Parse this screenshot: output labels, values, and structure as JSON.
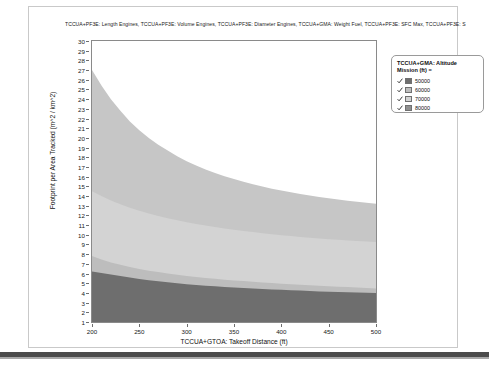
{
  "panel": {
    "chart_title": "TCCUA+PF3E: Length Engines, TCCUA+PF3E: Volume Engines, TCCUA+PF3E: Diameter Engines, TCCUA+GMA: Weight Fuel, TCCUA+PF3E: SFC Max, TCCUA+PF3E: S"
  },
  "legend": {
    "title_line1": "TCCUA+GMA: Altitude",
    "title_line2": "Mission (ft) =",
    "check_glyph": "check-mark-icon",
    "items": [
      {
        "label": "50000",
        "color": "#6e6e6e",
        "checked": true
      },
      {
        "label": "60000",
        "color": "#bdbdbd",
        "checked": true
      },
      {
        "label": "70000",
        "color": "#d3d3d3",
        "checked": true
      },
      {
        "label": "80000",
        "color": "#8f8f8f",
        "checked": true
      }
    ]
  },
  "chart_data": {
    "type": "area",
    "title": "TCCUA+PF3E: Length Engines, TCCUA+PF3E: Volume Engines, TCCUA+PF3E: Diameter Engines, TCCUA+GMA: Weight Fuel, TCCUA+PF3E: SFC Max, TCCUA+PF3E: S",
    "xlabel": "TCCUA+GTOA: Takeoff Distance (ft)",
    "ylabel": "Footprint per Area Tracked (m^2 / km^2)",
    "xlim": [
      200,
      500
    ],
    "ylim": [
      1,
      30
    ],
    "xticks": [
      200,
      250,
      300,
      350,
      400,
      450,
      500
    ],
    "yticks": [
      1,
      2,
      3,
      4,
      5,
      6,
      7,
      8,
      9,
      10,
      11,
      12,
      13,
      14,
      15,
      16,
      17,
      18,
      19,
      20,
      21,
      22,
      23,
      24,
      25,
      26,
      27,
      28,
      29,
      30
    ],
    "grid": false,
    "legend_position": "right-top",
    "stacking": "stacked-cumulative-top-edges",
    "x": [
      200,
      210,
      220,
      230,
      240,
      250,
      260,
      270,
      280,
      290,
      300,
      310,
      320,
      330,
      340,
      350,
      360,
      370,
      380,
      390,
      400,
      410,
      420,
      430,
      440,
      450,
      460,
      470,
      480,
      490,
      500
    ],
    "series": [
      {
        "name": "50000",
        "color": "#6e6e6e",
        "cumulative_top": [
          6.2,
          6.05,
          5.9,
          5.75,
          5.6,
          5.45,
          5.3,
          5.2,
          5.1,
          5.0,
          4.9,
          4.82,
          4.75,
          4.68,
          4.62,
          4.56,
          4.5,
          4.45,
          4.4,
          4.36,
          4.32,
          4.28,
          4.24,
          4.2,
          4.16,
          4.13,
          4.1,
          4.07,
          4.05,
          4.02,
          4.0
        ]
      },
      {
        "name": "60000",
        "color": "#bdbdbd",
        "cumulative_top": [
          7.8,
          7.45,
          7.15,
          6.9,
          6.68,
          6.48,
          6.3,
          6.15,
          6.0,
          5.88,
          5.76,
          5.65,
          5.55,
          5.46,
          5.37,
          5.29,
          5.22,
          5.15,
          5.08,
          5.02,
          4.96,
          4.9,
          4.85,
          4.8,
          4.75,
          4.7,
          4.65,
          4.6,
          4.55,
          4.5,
          4.45
        ]
      },
      {
        "name": "70000",
        "color": "#d3d3d3",
        "cumulative_top": [
          14.5,
          14.0,
          13.55,
          13.15,
          12.8,
          12.48,
          12.2,
          11.95,
          11.72,
          11.5,
          11.3,
          11.12,
          10.95,
          10.8,
          10.66,
          10.53,
          10.4,
          10.28,
          10.17,
          10.06,
          9.96,
          9.87,
          9.78,
          9.7,
          9.62,
          9.55,
          9.48,
          9.42,
          9.36,
          9.3,
          9.25
        ]
      },
      {
        "name": "80000",
        "color": "#c6c6c6",
        "cumulative_top": [
          27.0,
          25.4,
          24.0,
          22.8,
          21.7,
          20.8,
          20.0,
          19.3,
          18.7,
          18.1,
          17.6,
          17.15,
          16.75,
          16.38,
          16.05,
          15.75,
          15.47,
          15.22,
          14.98,
          14.76,
          14.56,
          14.38,
          14.21,
          14.05,
          13.9,
          13.76,
          13.63,
          13.51,
          13.4,
          13.3,
          13.2
        ]
      }
    ]
  }
}
